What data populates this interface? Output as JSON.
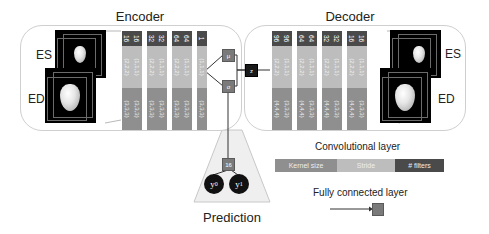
{
  "encoder": {
    "title": "Encoder",
    "volumes": [
      {
        "label": "ES"
      },
      {
        "label": "ED"
      }
    ],
    "layers": [
      {
        "filters": "16",
        "stride": "(2,2,2)",
        "kernel": "(3,3,3)"
      },
      {
        "filters": "16",
        "stride": "(1,1,1)",
        "kernel": "(3,3,3)"
      },
      {
        "filters": "32",
        "stride": "(2,2,2)",
        "kernel": "(3,3,3)"
      },
      {
        "filters": "32",
        "stride": "(1,1,1)",
        "kernel": "(3,3,3)"
      },
      {
        "filters": "64",
        "stride": "(2,2,2)",
        "kernel": "(3,3,3)"
      },
      {
        "filters": "64",
        "stride": "(1,1,1)",
        "kernel": "(3,3,3)"
      },
      {
        "filters": "1",
        "stride": "(1,1,1)",
        "kernel": "(3,3,3)"
      }
    ]
  },
  "latent": {
    "mu": "μ",
    "sigma": "σ",
    "z": "z"
  },
  "decoder": {
    "title": "Decoder",
    "volumes": [
      {
        "label": "ES"
      },
      {
        "label": "ED"
      }
    ],
    "layers": [
      {
        "filters": "96",
        "stride": "(2,2,2)",
        "kernel": "(4,4,4)"
      },
      {
        "filters": "96",
        "stride": "(1,1,1)",
        "kernel": "(3,3,3)"
      },
      {
        "filters": "64",
        "stride": "(2,2,2)",
        "kernel": "(4,4,4)"
      },
      {
        "filters": "64",
        "stride": "(1,1,1)",
        "kernel": "(3,3,3)"
      },
      {
        "filters": "32",
        "stride": "(2,2,2)",
        "kernel": "(4,4,4)"
      },
      {
        "filters": "32",
        "stride": "(1,1,1)",
        "kernel": "(3,3,3)"
      },
      {
        "filters": "16",
        "stride": "(2,2,2)",
        "kernel": "(4,4,4)"
      },
      {
        "filters": "16",
        "stride": "(1,1,1)",
        "kernel": "(3,3,3)"
      }
    ]
  },
  "prediction": {
    "title": "Prediction",
    "hidden_units": "16",
    "outputs": [
      {
        "symbol": "y",
        "sub": "0"
      },
      {
        "symbol": "y",
        "sub": "1"
      }
    ]
  },
  "legend": {
    "conv_title": "Convolutional layer",
    "kernel_label": "Kernel size",
    "stride_label": "Stride",
    "filters_label": "# filters",
    "fc_title": "Fully connected layer"
  },
  "colors": {
    "filters": "#4a4a4a",
    "stride": "#bdbdbd",
    "kernel": "#8f8f8f",
    "fc_node": "#7a7a7a",
    "latent_z": "#1a1a1a"
  }
}
